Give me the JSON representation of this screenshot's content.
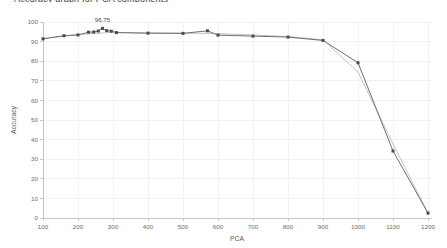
{
  "chart_title_clipped": "Accuracy graph for PCA components",
  "chart_data": {
    "type": "line",
    "title": "Accuracy graph for PCA components",
    "xlabel": "PCA",
    "ylabel": "Accuracy",
    "xlim": [
      100,
      1200
    ],
    "ylim": [
      0,
      100
    ],
    "xticks": [
      100,
      200,
      300,
      400,
      500,
      600,
      700,
      800,
      900,
      1000,
      1100,
      1200
    ],
    "xtick_labels": [
      "100",
      "200",
      "300",
      "400",
      "500",
      "600",
      "700",
      "800",
      "900",
      "1000",
      "1100",
      "1200"
    ],
    "yticks": [
      0,
      10,
      20,
      30,
      40,
      50,
      60,
      70,
      80,
      90,
      100
    ],
    "ytick_labels": [
      "0",
      "10",
      "20",
      "30",
      "40",
      "50",
      "60",
      "70",
      "80",
      "90",
      "100"
    ],
    "grid": true,
    "legend": false,
    "legend_position": "none",
    "annotations": [
      {
        "text": "96.75",
        "x": 270,
        "y": 96.75
      }
    ],
    "series": [
      {
        "name": "accuracy",
        "style": "line-with-markers",
        "color": "#6e6e6e",
        "marker_color": "#4a4a4a",
        "x": [
          100,
          160,
          200,
          230,
          245,
          258,
          270,
          282,
          295,
          310,
          400,
          500,
          570,
          600,
          700,
          800,
          900,
          1000,
          1100,
          1200
        ],
        "values": [
          91.4,
          93.0,
          93.4,
          94.8,
          94.9,
          95.4,
          96.75,
          95.6,
          95.3,
          94.6,
          94.3,
          94.2,
          95.5,
          93.3,
          92.8,
          92.3,
          90.6,
          79.2,
          34.2,
          2.5
        ]
      },
      {
        "name": "trend",
        "style": "smooth-line",
        "color": "#c4c4c4",
        "x": [
          100,
          200,
          300,
          400,
          500,
          600,
          700,
          800,
          900,
          1000,
          1100,
          1200
        ],
        "values": [
          91.6,
          93.6,
          94.7,
          94.4,
          94.3,
          94.1,
          93.4,
          92.6,
          90.9,
          74.5,
          37.8,
          2.5
        ]
      }
    ]
  }
}
